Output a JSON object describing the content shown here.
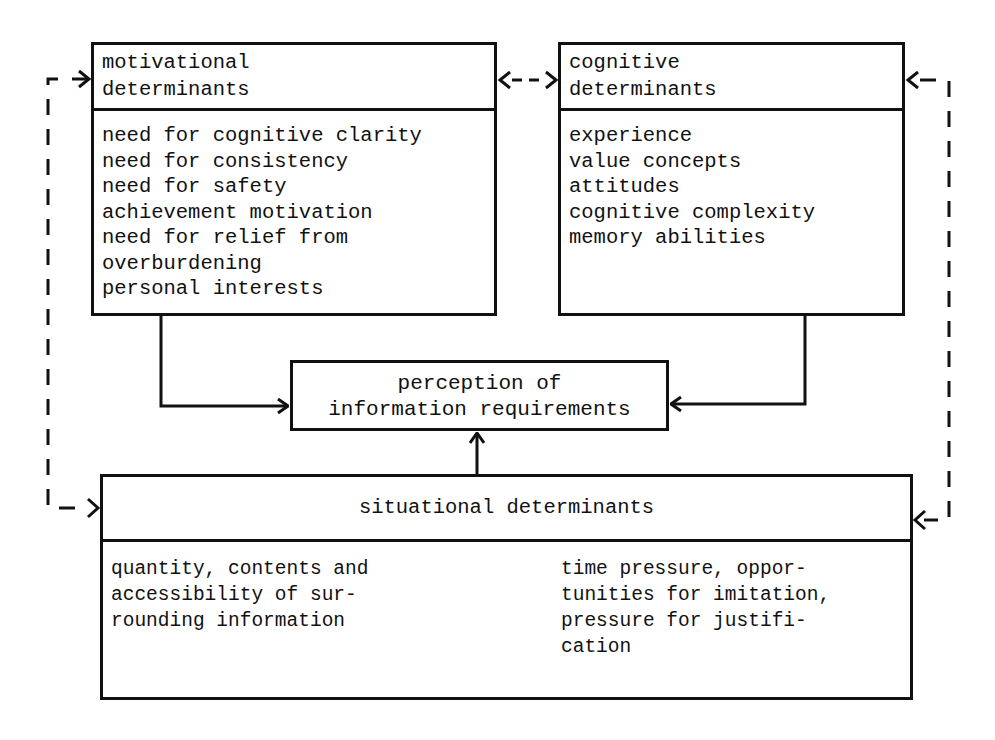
{
  "diagram": {
    "motivational": {
      "title_lines": [
        "motivational",
        "determinants"
      ],
      "items": [
        "need for cognitive clarity",
        "need for consistency",
        "need for safety",
        "achievement motivation",
        "need for relief from",
        "overburdening",
        "personal interests"
      ]
    },
    "cognitive": {
      "title_lines": [
        "cognitive",
        "determinants"
      ],
      "items": [
        "experience",
        "value concepts",
        "attitudes",
        "cognitive complexity",
        "memory abilities"
      ]
    },
    "perception": {
      "title_lines": [
        "perception of",
        "information requirements"
      ]
    },
    "situational": {
      "title": "situational determinants",
      "left_lines": [
        "quantity, contents and",
        "accessibility of sur-",
        "rounding information"
      ],
      "right_lines": [
        "time pressure, oppor-",
        "tunities for imitation,",
        "pressure for justifi-",
        "cation"
      ]
    },
    "connections": [
      {
        "from": "motivational",
        "to": "perception",
        "style": "solid"
      },
      {
        "from": "cognitive",
        "to": "perception",
        "style": "solid"
      },
      {
        "from": "situational",
        "to": "perception",
        "style": "solid"
      },
      {
        "from": "motivational",
        "to": "cognitive",
        "style": "dashed",
        "bidirectional": true
      },
      {
        "from": "motivational",
        "to": "situational",
        "style": "dashed",
        "bidirectional": true
      },
      {
        "from": "cognitive",
        "to": "situational",
        "style": "dashed",
        "bidirectional": true
      }
    ]
  }
}
